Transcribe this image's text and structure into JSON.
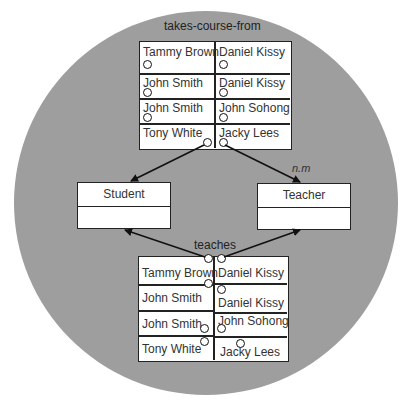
{
  "diagram": {
    "top_relation": {
      "title": "takes-course-from",
      "rows": [
        {
          "left": "Tammy Brown",
          "right": "Daniel Kissy"
        },
        {
          "left": "John Smith",
          "right": "Daniel Kissy"
        },
        {
          "left": "John Smith",
          "right": "John Sohong"
        },
        {
          "left": "Tony White",
          "right": "Jacky Lees"
        }
      ],
      "multiplicity": "n.m"
    },
    "classes": {
      "student": {
        "name": "Student"
      },
      "teacher": {
        "name": "Teacher"
      }
    },
    "bottom_relation": {
      "title": "teaches",
      "rows": [
        {
          "left": "Tammy Brown",
          "right": "Daniel Kissy"
        },
        {
          "left": "John Smith",
          "right": "Daniel Kissy"
        },
        {
          "left": "John Smith",
          "right": "John Sohong"
        },
        {
          "left": "Tony White",
          "right": "Jacky Lees"
        }
      ]
    },
    "colors": {
      "background_circle": "#9e9e9e",
      "line": "#222222",
      "box_fill": "#ffffff"
    }
  }
}
